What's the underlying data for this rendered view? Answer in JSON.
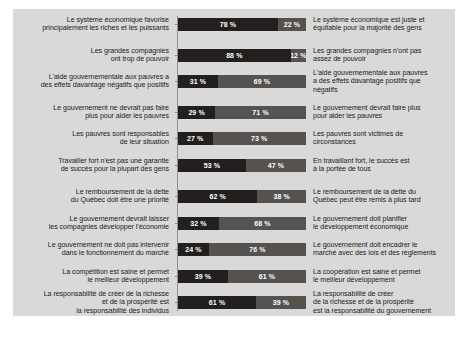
{
  "panel": {
    "background_color": "#d9d9d9",
    "bar_color_left": "#231f1e",
    "bar_color_right": "#56524f",
    "value_text_color": "#ffffff",
    "label_text_color": "#1b1b1b"
  },
  "chart_data": {
    "type": "bar",
    "subtype": "stacked-horizontal-100pct",
    "title": "",
    "subtitle": "",
    "xlabel": "",
    "ylabel": "",
    "xlim": [
      0,
      100
    ],
    "grid": false,
    "legend_position": "none",
    "units": "%",
    "series": [
      {
        "name": "Gauche",
        "color": "#231f1e",
        "values": [
          78,
          88,
          31,
          29,
          27,
          53,
          62,
          32,
          24,
          39,
          61
        ]
      },
      {
        "name": "Droite",
        "color": "#56524f",
        "values": [
          22,
          12,
          69,
          71,
          73,
          47,
          38,
          68,
          76,
          61,
          39
        ]
      }
    ],
    "categories": [
      "Le système économique favorise principalement les riches et les puissants",
      "Les grandes compagnies ont trop de pouvoir",
      "L'aide gouvernementale aux pauvres a des effets davantage négatifs que positifs",
      "Le gouvernement ne devrait pas faire plus pour aider les pauvres",
      "Les pauvres sont responsables de leur situation",
      "Travailler fort n'est pas une garantie de succès pour la plupart des gens",
      "Le remboursement de la dette du Québec doit être une priorité",
      "Le gouvernement devrait laisser les compagnies développer l'économie",
      "Le gouvernement ne doit pas intervenir dans le fonctionnement du marché",
      "La compétition est saine et permet le meilleur développement",
      "La responsabilité de créer de la richesse et de la prospérité est la responsabilité des individus"
    ],
    "categories_right": [
      "Le système économique est juste et équitable pour la majorité des gens",
      "Les grandes compagnies n'ont pas assez de pouvoir",
      "L'aide gouvernementale aux pauvres a des effets davantage positifs que négatifs",
      "Le gouvernement devrait faire plus pour aider les pauvres",
      "Les pauvres sont victimes de circonstances",
      "En travaillant fort, le succès est à la portée de tous",
      "Le remboursement de la dette du Québec peut être remis à plus tard",
      "Le gouvernement doit planifier le développement économique",
      "Le gouvernement doit encadrer le marché avec des lois et des règlements",
      "La coopération est saine et permet le meilleur développement",
      "La responsabilité de créer de la richesse et de la prospérité est la responsabilité du gouvernement"
    ]
  },
  "rows": [
    {
      "left_lines": [
        "Le système économique favorise",
        "principalement les riches et les puissants"
      ],
      "left_value": "78 %",
      "right_value": "22 %",
      "left_pct": 78,
      "right_pct": 22,
      "right_lines": [
        "Le système économique est juste et",
        "équitable pour la majorité des gens"
      ]
    },
    {
      "left_lines": [
        "Les grandes compagnies",
        "ont trop de pouvoir"
      ],
      "left_value": "88 %",
      "right_value": "12 %",
      "left_pct": 88,
      "right_pct": 12,
      "right_lines": [
        "Les grandes compagnies n'ont pas",
        "assez de pouvoir"
      ]
    },
    {
      "left_lines": [
        "L'aide gouvernementale aux pauvres a",
        "des effets davantage négatifs que positifs"
      ],
      "left_value": "31 %",
      "right_value": "69 %",
      "left_pct": 31,
      "right_pct": 69,
      "right_lines": [
        "L'aide gouvernementale aux pauvres",
        "a des effets davantage positifs que",
        "négatifs"
      ]
    },
    {
      "left_lines": [
        "Le gouvernement ne devrait pas faire",
        "plus pour aider les pauvres"
      ],
      "left_value": "29 %",
      "right_value": "71 %",
      "left_pct": 29,
      "right_pct": 71,
      "right_lines": [
        "Le gouvernement devrait faire plus",
        "pour aider les pauvres"
      ]
    },
    {
      "left_lines": [
        "Les pauvres sont responsables",
        "de leur situation"
      ],
      "left_value": "27 %",
      "right_value": "73 %",
      "left_pct": 27,
      "right_pct": 73,
      "right_lines": [
        "Les pauvres sont victimes de",
        "circonstances"
      ]
    },
    {
      "left_lines": [
        "Travailler fort n'est pas une garantie",
        "de succès pour la plupart des gens"
      ],
      "left_value": "53 %",
      "right_value": "47 %",
      "left_pct": 53,
      "right_pct": 47,
      "right_lines": [
        "En travaillant fort, le succès est",
        "à la portée de tous"
      ]
    },
    {
      "left_lines": [
        "Le remboursement de la dette",
        "du Québec doit être une priorité"
      ],
      "left_value": "62 %",
      "right_value": "38 %",
      "left_pct": 62,
      "right_pct": 38,
      "right_lines": [
        "Le remboursement de la dette du",
        "Québec peut être remis à plus tard"
      ]
    },
    {
      "left_lines": [
        "Le gouvernement devrait laisser",
        "les compagnies développer l'économie"
      ],
      "left_value": "32 %",
      "right_value": "68 %",
      "left_pct": 32,
      "right_pct": 68,
      "right_lines": [
        "Le gouvernement doit planifier",
        "le développement économique"
      ]
    },
    {
      "left_lines": [
        "Le gouvernement ne doit pas intervenir",
        "dans le fonctionnement du marché"
      ],
      "left_value": "24 %",
      "right_value": "76 %",
      "left_pct": 24,
      "right_pct": 76,
      "right_lines": [
        "Le gouvernement doit encadrer le",
        "marché avec des lois et des règlements"
      ]
    },
    {
      "left_lines": [
        "La compétition est saine et permet",
        "le meilleur développement"
      ],
      "left_value": "39 %",
      "right_value": "61 %",
      "left_pct": 39,
      "right_pct": 61,
      "right_lines": [
        "La coopération est saine et permet",
        "le meilleur développement"
      ]
    },
    {
      "left_lines": [
        "La responsabilité de créer de la richesse",
        "et de la prospérité est",
        "la responsabilité des individus"
      ],
      "left_value": "61 %",
      "right_value": "39 %",
      "left_pct": 61,
      "right_pct": 39,
      "right_lines": [
        "La responsabilité de créer",
        "de la richesse et de la prospérité",
        "est la responsabilité du gouvernement"
      ]
    }
  ]
}
